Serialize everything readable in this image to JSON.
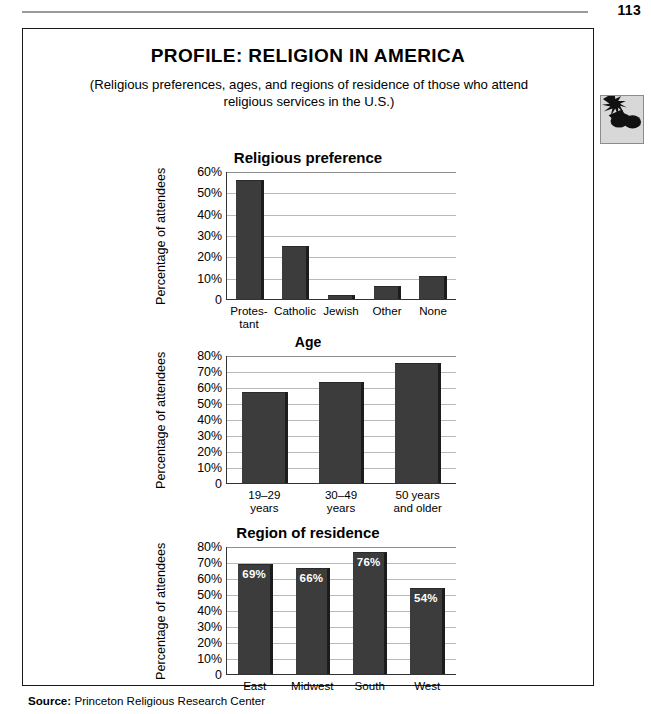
{
  "page": {
    "folio": "113",
    "title": "PROFILE: RELIGION IN AMERICA",
    "subtitle": "(Religious preferences, ages, and regions of residence of those who attend religious services in the U.S.)",
    "source_label": "Source:",
    "source_text": "Princeton Religious Research Center",
    "icon": "sunglasses-sun-icon",
    "accent_color": "#3c3c3c",
    "grid_color": "#b9b9b9",
    "axis_color": "#333333"
  },
  "chart_data": [
    {
      "type": "bar",
      "title": "Religious preference",
      "xlabel": "",
      "ylabel": "Percentage of attendees",
      "categories": [
        "Protes-\ntant",
        "Catholic",
        "Jewish",
        "Other",
        "None"
      ],
      "values": [
        56,
        25,
        2,
        6,
        11
      ],
      "ylim": [
        0,
        60
      ],
      "yticks": [
        "0",
        "10%",
        "20%",
        "30%",
        "40%",
        "50%",
        "60%"
      ],
      "ytick_values": [
        0,
        10,
        20,
        30,
        40,
        50,
        60
      ],
      "grid": true,
      "legend": "none",
      "show_values": false
    },
    {
      "type": "bar",
      "title": "Age",
      "xlabel": "",
      "ylabel": "Percentage of attendees",
      "categories": [
        "19–29\nyears",
        "30–49\nyears",
        "50 years\nand older"
      ],
      "values": [
        57,
        63,
        75
      ],
      "ylim": [
        0,
        80
      ],
      "yticks": [
        "0",
        "10%",
        "20%",
        "30%",
        "40%",
        "50%",
        "60%",
        "70%",
        "80%"
      ],
      "ytick_values": [
        0,
        10,
        20,
        30,
        40,
        50,
        60,
        70,
        80
      ],
      "grid": true,
      "legend": "none",
      "show_values": false
    },
    {
      "type": "bar",
      "title": "Region of residence",
      "xlabel": "",
      "ylabel": "Percentage of attendees",
      "categories": [
        "East",
        "Midwest",
        "South",
        "West"
      ],
      "values": [
        69,
        66,
        76,
        54
      ],
      "value_labels": [
        "69%",
        "66%",
        "76%",
        "54%"
      ],
      "ylim": [
        0,
        80
      ],
      "yticks": [
        "0",
        "10%",
        "20%",
        "30%",
        "40%",
        "50%",
        "60%",
        "70%",
        "80%"
      ],
      "ytick_values": [
        0,
        10,
        20,
        30,
        40,
        50,
        60,
        70,
        80
      ],
      "grid": true,
      "legend": "none",
      "show_values": true
    }
  ]
}
